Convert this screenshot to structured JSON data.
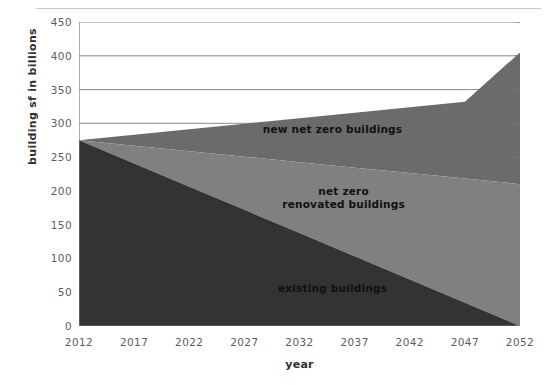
{
  "chart_data": {
    "type": "area",
    "stacked": true,
    "title": "",
    "subtitle": "",
    "xlabel": "year",
    "ylabel": "building sf in billions",
    "xlim": [
      2012,
      2052
    ],
    "ylim": [
      0,
      450
    ],
    "x": [
      2012,
      2017,
      2022,
      2027,
      2032,
      2037,
      2042,
      2047,
      2052
    ],
    "xticks": [
      "2012",
      "2017",
      "2022",
      "2027",
      "2032",
      "2037",
      "2042",
      "2047",
      "2052"
    ],
    "xtick_minor_step": 1,
    "yticks": [
      "0",
      "50",
      "100",
      "150",
      "200",
      "250",
      "300",
      "350",
      "400",
      "450"
    ],
    "ytick_values": [
      0,
      50,
      100,
      150,
      200,
      250,
      300,
      350,
      400,
      450
    ],
    "grid": "horizontal-above-300-only",
    "gridline_values": [
      300,
      350,
      400,
      450
    ],
    "legend": "inline-labels",
    "series": [
      {
        "name": "existing buildings",
        "color": "#333333",
        "values": [
          275,
          240.6,
          206.3,
          171.9,
          137.5,
          103.1,
          68.8,
          34.4,
          0
        ],
        "label_x": 2035,
        "label_y": 55
      },
      {
        "name": "net zero\nrenovated buildings",
        "color": "#808080",
        "values": [
          0,
          26.3,
          52.5,
          78.8,
          105,
          131.3,
          157.5,
          183.8,
          210
        ],
        "label_x": 2036,
        "label_y": 190
      },
      {
        "name": "new net zero buildings",
        "color": "#6b6b6b",
        "values": [
          0,
          16.3,
          32.5,
          48.8,
          65,
          81.3,
          97.5,
          113.8,
          195
        ],
        "label_x": 2035,
        "label_y": 290
      }
    ],
    "stack_top_values": [
      275,
      283.2,
      291.3,
      299.5,
      307.5,
      315.7,
      323.8,
      332,
      405
    ],
    "annotations": [
      {
        "text": "new net zero buildings",
        "x": 2035,
        "y": 290
      },
      {
        "text": "net zero\nrenovated buildings",
        "x": 2036,
        "y": 190
      },
      {
        "text": "existing buildings",
        "x": 2035,
        "y": 55
      }
    ],
    "colors": {
      "existing": "#333333",
      "renovated": "#808080",
      "new_net_zero": "#6b6b6b",
      "gridline": "#8a8a8a",
      "axis": "#7a7a7a",
      "tick_text": "#5d5d5d",
      "title_text": "#2f2f2f",
      "background": "#ffffff",
      "top_rule": "#c9c9c9"
    }
  },
  "axes": {
    "x_title": "year",
    "y_title": "building sf in billions"
  }
}
